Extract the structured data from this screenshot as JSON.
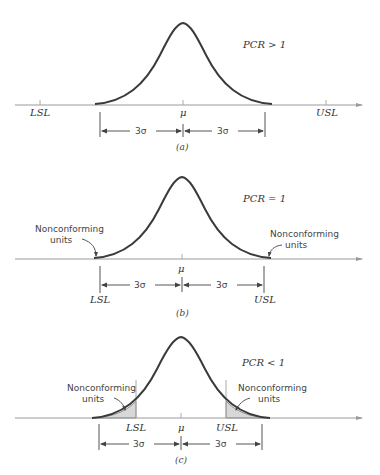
{
  "figure": {
    "panels": [
      {
        "id": "a",
        "caption": "(a)",
        "pcr_label": "PCR > 1",
        "mean_label": "μ",
        "lsl_label": "LSL",
        "usl_label": "USL",
        "left_span_label": "3σ",
        "right_span_label": "3σ"
      },
      {
        "id": "b",
        "caption": "(b)",
        "pcr_label": "PCR = 1",
        "mean_label": "μ",
        "lsl_label": "LSL",
        "usl_label": "USL",
        "left_span_label": "3σ",
        "right_span_label": "3σ",
        "left_annotation": [
          "Nonconforming",
          "units"
        ],
        "right_annotation": [
          "Nonconforming",
          "units"
        ]
      },
      {
        "id": "c",
        "caption": "(c)",
        "pcr_label": "PCR < 1",
        "mean_label": "μ",
        "lsl_label": "LSL",
        "usl_label": "USL",
        "left_span_label": "3σ",
        "right_span_label": "3σ",
        "left_annotation": [
          "Nonconforming",
          "units"
        ],
        "right_annotation": [
          "Nonconforming",
          "units"
        ]
      }
    ],
    "colors": {
      "curve": "#3a3a3a",
      "axis": "#9a9a9a",
      "shade": "#d8d8d8"
    }
  }
}
